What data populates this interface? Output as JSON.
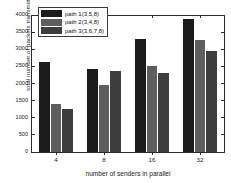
{
  "chart_data": {
    "type": "bar",
    "title": "",
    "xlabel": "number of senders in parallel",
    "ylabel": "total number of packets transmitted",
    "categories": [
      "4",
      "8",
      "16",
      "32"
    ],
    "series": [
      {
        "name": "path 1(3,5,8)",
        "color": "#1b1b1b",
        "values": [
          2620,
          2420,
          3300,
          3870
        ]
      },
      {
        "name": "path 2(3,4,8)",
        "color": "#5e5e5e",
        "values": [
          1410,
          1970,
          2520,
          3280
        ]
      },
      {
        "name": "path 3(3,6,7,8)",
        "color": "#3d3d3d",
        "values": [
          1265,
          2370,
          2320,
          2940
        ]
      }
    ],
    "ylim": [
      0,
      4000
    ],
    "yticks": [
      0,
      500,
      1000,
      1500,
      2000,
      2500,
      3000,
      3500,
      4000
    ],
    "ytick_labels": [
      "0",
      "500",
      "1000",
      "1500",
      "2000",
      "2500",
      "3000",
      "3500",
      "4000"
    ],
    "grid": false,
    "legend_position": "upper left",
    "axis_color": "#2b2b2b",
    "background": "#ffffff"
  }
}
